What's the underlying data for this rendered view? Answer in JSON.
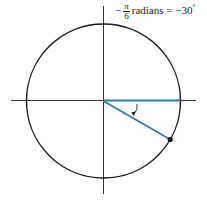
{
  "label": {
    "sign": "−",
    "numerator": "π",
    "denominator": "6",
    "text": "radians = −30",
    "degree": "°"
  },
  "diagram": {
    "center": [
      103.5,
      101
    ],
    "radius": 77,
    "angle_degrees": -30,
    "colors": {
      "circle": "#1a1a1a",
      "axes": "#333333",
      "terminal_side": "#2a7aa3",
      "initial_side": "#2a7aa3",
      "point": "#111111"
    }
  }
}
